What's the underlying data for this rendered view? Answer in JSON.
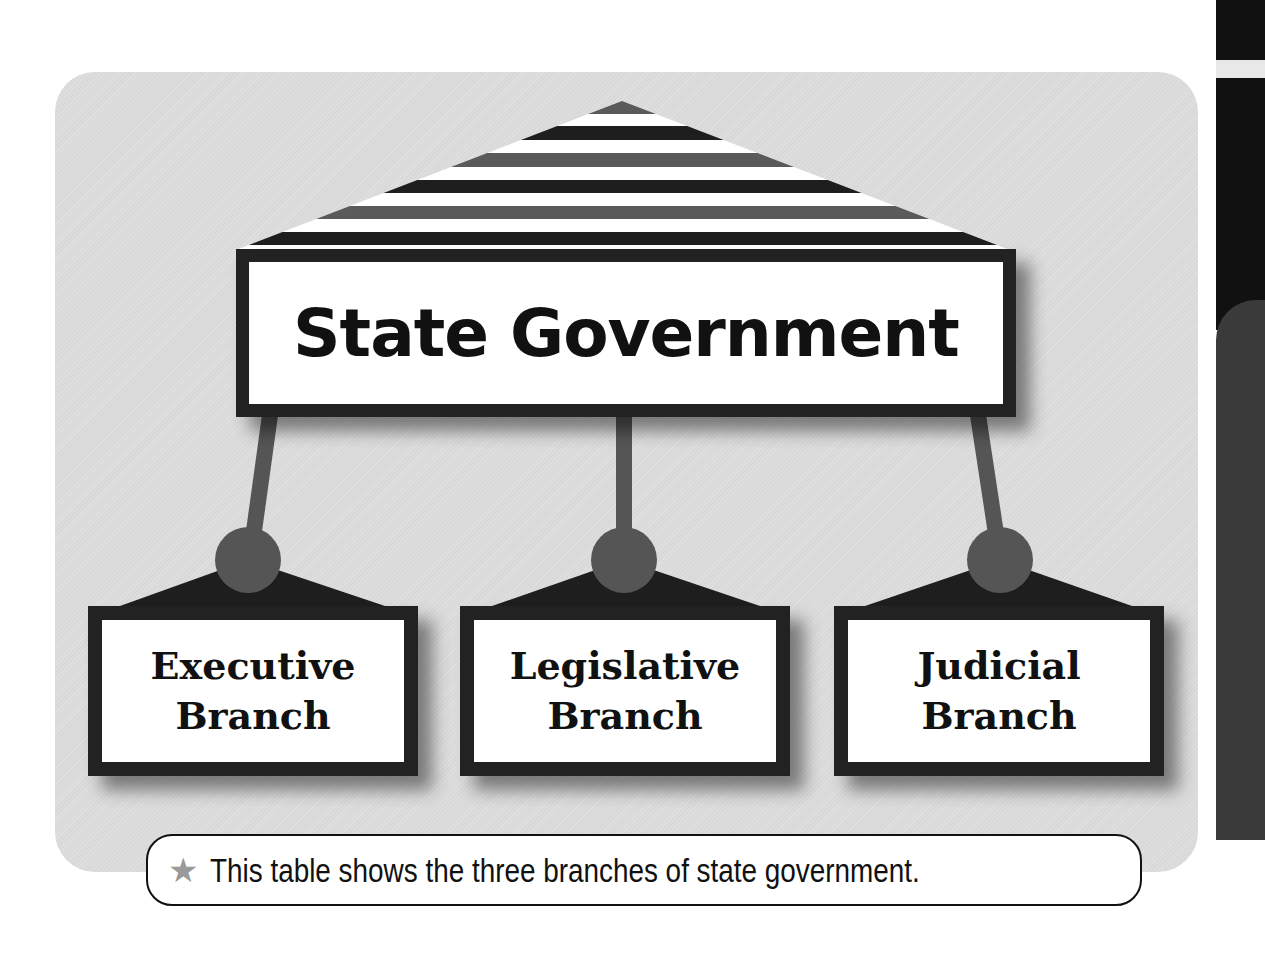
{
  "diagram": {
    "title": "State Government",
    "branches": [
      {
        "line1": "Executive",
        "line2": "Branch"
      },
      {
        "line1": "Legislative",
        "line2": "Branch"
      },
      {
        "line1": "Judicial",
        "line2": "Branch"
      }
    ],
    "caption": "This table shows the three branches of state government.",
    "caption_icon": "star-icon",
    "colors": {
      "panel": "#d9d9d9",
      "frame": "#222222",
      "connector": "#555555",
      "stripe_dark": "#1e1e1e",
      "stripe_gray": "#5a5a5a",
      "stripe_white": "#ffffff"
    }
  }
}
